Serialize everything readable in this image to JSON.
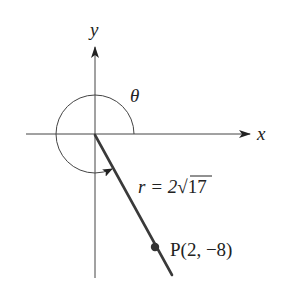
{
  "diagram": {
    "axes": {
      "x_label": "x",
      "y_label": "y"
    },
    "angle": {
      "label": "θ",
      "description": "angle in standard position measured counterclockwise from positive x-axis to terminal side"
    },
    "terminal_side": {
      "radius_label_prefix": "r = 2",
      "radius_label_radical": "√17",
      "point_label": "P(2, −8)",
      "point": {
        "x": 2,
        "y": -8
      }
    },
    "colors": {
      "axis": "#444444",
      "ray": "#3a3a3a",
      "point": "#333333",
      "text": "#222222"
    }
  }
}
